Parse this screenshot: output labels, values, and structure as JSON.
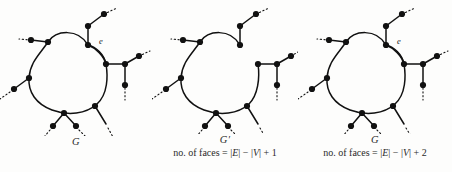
{
  "figure": {
    "background_color": "#fdfdfc",
    "ink_color": "#111111"
  },
  "panels": [
    {
      "id": "panel-1",
      "graph_name": "G",
      "edge_label": "e",
      "has_edge_e": true,
      "caption": "",
      "faces_formula": ""
    },
    {
      "id": "panel-2",
      "graph_name": "G′",
      "edge_label": "",
      "has_edge_e": false,
      "caption": "no. of faces = |E| − |V| + 1",
      "faces_prefix": "no. of faces = |",
      "faces_E": "E",
      "faces_mid": "| − |",
      "faces_V": "V",
      "faces_suffix": "| + 1"
    },
    {
      "id": "panel-3",
      "graph_name": "G",
      "edge_label": "e",
      "has_edge_e": true,
      "caption": "no. of faces = |E| − |V| + 2",
      "faces_prefix": "no. of faces = |",
      "faces_E": "E",
      "faces_mid": "| − |",
      "faces_V": "V",
      "faces_suffix": "| + 2"
    }
  ],
  "legend": {
    "node_shape": "filled-circle",
    "edge_style": "solid-curve",
    "continuation_style": "dotted"
  }
}
